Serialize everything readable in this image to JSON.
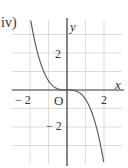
{
  "figure_label": "iv)",
  "chart_data": {
    "type": "line",
    "title": "iv)",
    "xlabel": "x",
    "ylabel": "y",
    "function": "y = -x^3/2",
    "xlim": [
      -2.9,
      3.0
    ],
    "ylim": [
      -3.9,
      3.8
    ],
    "xticks": [
      -2,
      2
    ],
    "yticks": [
      2,
      -2
    ],
    "origin_label": "O",
    "grid": true,
    "x": [
      -1.95,
      -1.5,
      -1.0,
      -0.5,
      0,
      0.5,
      1.0,
      1.5,
      1.98
    ],
    "y": [
      3.71,
      1.69,
      0.5,
      0.06,
      0,
      -0.06,
      -0.5,
      -1.69,
      -3.88
    ]
  },
  "labels": {
    "x_axis": "x",
    "y_axis": "y",
    "origin": "O",
    "tick_x_neg2": "− 2",
    "tick_x_2": "2",
    "tick_y_2": "2",
    "tick_y_neg2": "− 2"
  },
  "colors": {
    "grid": "#d4d4d4",
    "axis": "#333333",
    "curve": "#555555"
  }
}
